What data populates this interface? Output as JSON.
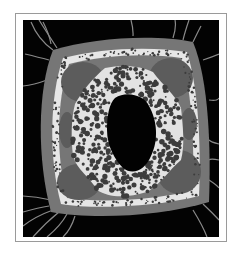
{
  "image": {
    "subject": "plant stem cross-section micrograph",
    "colors": {
      "frame_border": "#9a9a9a",
      "background": "#030303",
      "cortex": "#767676",
      "cortex_lobes": "#5c5c5c",
      "inner_ring": "#e6e6e6",
      "ground_tissue": "#e2e2e2",
      "cells": "#3c3c3c",
      "pith_cavity": "#020202",
      "hairs": "#8a8a8a"
    }
  }
}
